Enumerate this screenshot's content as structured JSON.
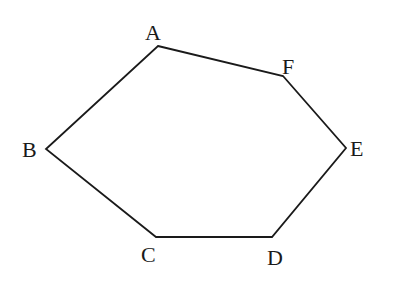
{
  "figure": {
    "type": "hexagon",
    "stroke_color": "#1a1a1a",
    "background": "#ffffff",
    "vertices": [
      {
        "name": "A",
        "x": 158,
        "y": 46,
        "label": "A",
        "label_x": 145,
        "label_y": 40
      },
      {
        "name": "F",
        "x": 283,
        "y": 76,
        "label": "F",
        "label_x": 282,
        "label_y": 74
      },
      {
        "name": "E",
        "x": 346,
        "y": 148,
        "label": "E",
        "label_x": 350,
        "label_y": 156
      },
      {
        "name": "D",
        "x": 272,
        "y": 237,
        "label": "D",
        "label_x": 267,
        "label_y": 265
      },
      {
        "name": "C",
        "x": 156,
        "y": 237,
        "label": "C",
        "label_x": 141,
        "label_y": 262
      },
      {
        "name": "B",
        "x": 46,
        "y": 149,
        "label": "B",
        "label_x": 22,
        "label_y": 157
      }
    ],
    "edges": [
      "AF",
      "FE",
      "ED",
      "DC",
      "CB",
      "BA"
    ]
  },
  "labels": {
    "A": "A",
    "B": "B",
    "C": "C",
    "D": "D",
    "E": "E",
    "F": "F"
  }
}
